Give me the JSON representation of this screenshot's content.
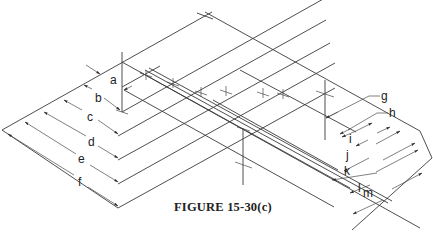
{
  "figure": {
    "caption": "FIGURE 15-30(c)",
    "left_dimension_labels": [
      "a",
      "b",
      "c",
      "d",
      "e",
      "f"
    ],
    "right_dimension_labels": [
      "g",
      "h",
      "i",
      "j",
      "k",
      "l",
      "m"
    ]
  },
  "colors": {
    "line": "#3a3a3a",
    "background": "#ffffff",
    "text": "#222222"
  }
}
